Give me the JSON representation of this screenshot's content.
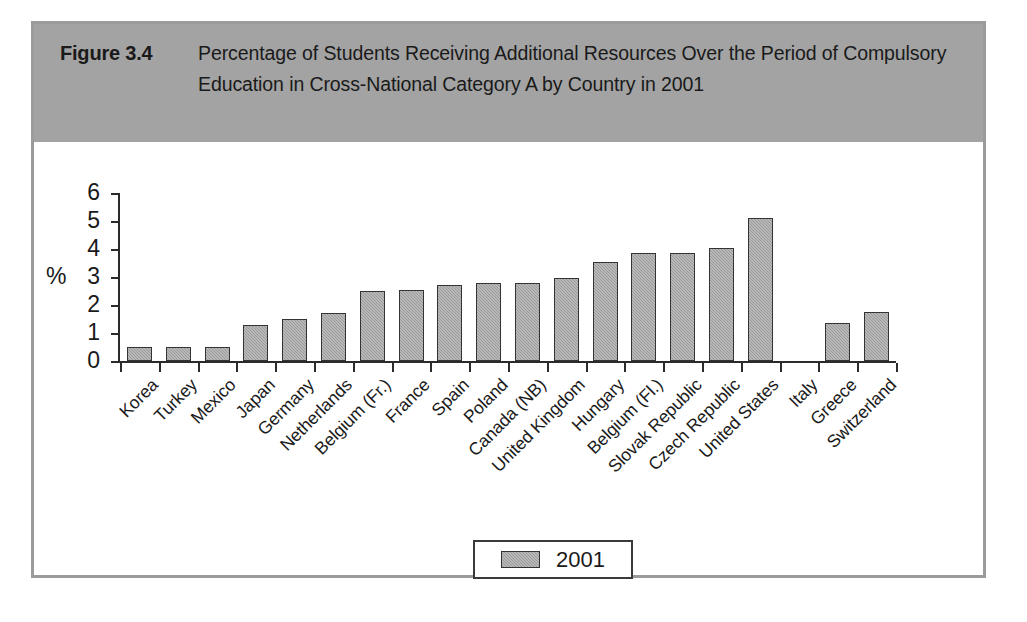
{
  "figure": {
    "number": "Figure 3.4",
    "caption": "Percentage of Students Receiving Additional Resources Over the Period of Compulsory Education in Cross-National Category A by Country in 2001"
  },
  "chart_data": {
    "type": "bar",
    "title": "Percentage of Students Receiving Additional Resources Over the Period of Compulsory Education in Cross-National Category A by Country in 2001",
    "xlabel": "",
    "ylabel": "%",
    "ylim": [
      0,
      6
    ],
    "yticks": [
      0,
      1,
      2,
      3,
      4,
      5,
      6
    ],
    "ytick_labels": [
      "0",
      "1",
      "2",
      "3",
      "4",
      "5",
      "6"
    ],
    "grid": false,
    "legend_position": "bottom-center",
    "bar_color": "#9a9a9a",
    "bar_edge_color": "#333333",
    "categories": [
      "Korea",
      "Turkey",
      "Mexico",
      "Japan",
      "Germany",
      "Netherlands",
      "Belgium (Fr.)",
      "France",
      "Spain",
      "Poland",
      "Canada (NB)",
      "United Kingdom",
      "Hungary",
      "Belgium (Fl.)",
      "Slovak Republic",
      "Czech Republic",
      "United States",
      "Italy",
      "Greece",
      "Switzerland"
    ],
    "series": [
      {
        "name": "2001",
        "values": [
          0.5,
          0.5,
          0.5,
          1.3,
          1.5,
          1.7,
          2.5,
          2.55,
          2.7,
          2.8,
          2.8,
          2.95,
          3.55,
          3.85,
          3.85,
          4.05,
          5.1,
          0,
          1.35,
          1.75
        ]
      }
    ]
  },
  "legend": {
    "entries": [
      {
        "label": "2001",
        "swatch": "#9a9a9a"
      }
    ]
  },
  "colors": {
    "caption_band": "#a3a3a3",
    "frame_border": "#9b9b9b",
    "axis": "#2b2b2b",
    "bar_fill": "#9a9a9a",
    "text": "#1a1a1a"
  }
}
